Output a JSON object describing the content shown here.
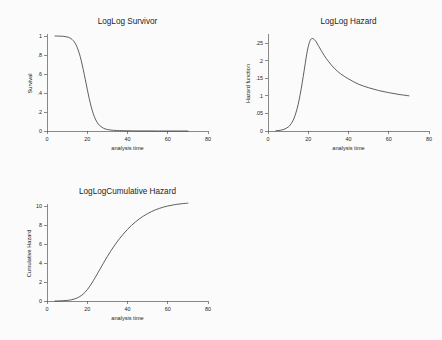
{
  "page": {
    "background_color": "#fbfbfb",
    "layout": "2x2 grid of plot panels, bottom-right empty"
  },
  "chart_data": [
    {
      "id": "survivor",
      "type": "line",
      "title": "LogLog Survivor",
      "xlabel": "analysis time",
      "ylabel": "Survival",
      "xlim": [
        0,
        80
      ],
      "ylim": [
        0,
        1
      ],
      "xticks": [
        0,
        20,
        40,
        60,
        80
      ],
      "xticklabels": [
        "0",
        "20",
        "40",
        "60",
        "80"
      ],
      "yticks": [
        0,
        0.2,
        0.4,
        0.6,
        0.8,
        1
      ],
      "yticklabels": [
        "0",
        ".2",
        ".4",
        ".6",
        ".8",
        "1"
      ],
      "grid": false,
      "legend": "none",
      "line_color": "#2b2b2b",
      "x": [
        4,
        6,
        8,
        10,
        11,
        12,
        13,
        14,
        15,
        16,
        17,
        18,
        19,
        20,
        21,
        22,
        23,
        24,
        25,
        26,
        28,
        30,
        33,
        36,
        40,
        45,
        50,
        55,
        60,
        65,
        70
      ],
      "y": [
        1.0,
        0.999,
        0.997,
        0.99,
        0.983,
        0.972,
        0.953,
        0.924,
        0.88,
        0.82,
        0.742,
        0.648,
        0.545,
        0.44,
        0.34,
        0.252,
        0.181,
        0.127,
        0.088,
        0.061,
        0.03,
        0.016,
        0.007,
        0.004,
        0.002,
        0.001,
        0.001,
        0.0,
        0.0,
        0.0,
        0.0
      ]
    },
    {
      "id": "hazard",
      "type": "line",
      "title": "LogLog Hazard",
      "xlabel": "analysis time",
      "ylabel": "Hazard function",
      "xlim": [
        0,
        80
      ],
      "ylim": [
        0,
        0.27
      ],
      "xticks": [
        0,
        20,
        40,
        60,
        80
      ],
      "xticklabels": [
        "0",
        "20",
        "40",
        "60",
        "80"
      ],
      "yticks": [
        0,
        0.05,
        0.1,
        0.15,
        0.2,
        0.25
      ],
      "yticklabels": [
        "0",
        ".05",
        ".1",
        ".15",
        ".2",
        ".25"
      ],
      "grid": false,
      "legend": "none",
      "line_color": "#2b2b2b",
      "x": [
        4,
        6,
        8,
        10,
        11,
        12,
        13,
        14,
        15,
        16,
        17,
        18,
        19,
        20,
        21,
        22,
        23,
        24,
        25,
        26,
        28,
        30,
        33,
        36,
        40,
        45,
        50,
        55,
        60,
        65,
        70
      ],
      "y": [
        0.001,
        0.002,
        0.005,
        0.011,
        0.017,
        0.025,
        0.037,
        0.054,
        0.076,
        0.104,
        0.137,
        0.173,
        0.21,
        0.24,
        0.258,
        0.263,
        0.26,
        0.253,
        0.243,
        0.233,
        0.214,
        0.198,
        0.178,
        0.163,
        0.148,
        0.133,
        0.123,
        0.115,
        0.109,
        0.104,
        0.1
      ]
    },
    {
      "id": "cumulative-hazard",
      "type": "line",
      "title": "LogLogCumulative Hazard",
      "xlabel": "analysis time",
      "ylabel": "Cumulative Hazard",
      "xlim": [
        0,
        80
      ],
      "ylim": [
        0,
        10
      ],
      "xticks": [
        0,
        20,
        40,
        60,
        80
      ],
      "xticklabels": [
        "0",
        "20",
        "40",
        "60",
        "80"
      ],
      "yticks": [
        0,
        2,
        4,
        6,
        8,
        10
      ],
      "yticklabels": [
        "0",
        "2",
        "4",
        "6",
        "8",
        "10"
      ],
      "grid": false,
      "legend": "none",
      "line_color": "#2b2b2b",
      "x": [
        4,
        6,
        8,
        10,
        12,
        14,
        16,
        18,
        20,
        22,
        24,
        26,
        28,
        30,
        33,
        36,
        40,
        44,
        48,
        52,
        56,
        60,
        64,
        68,
        70
      ],
      "y": [
        0.0,
        0.01,
        0.03,
        0.06,
        0.12,
        0.24,
        0.43,
        0.73,
        1.19,
        1.79,
        2.49,
        3.23,
        3.97,
        4.69,
        5.68,
        6.55,
        7.54,
        8.33,
        8.95,
        9.42,
        9.76,
        10.0,
        10.16,
        10.26,
        10.3
      ]
    }
  ]
}
